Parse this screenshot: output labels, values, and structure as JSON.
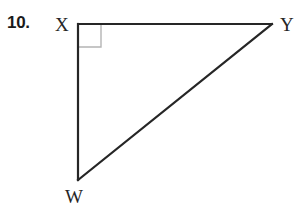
{
  "problem": {
    "number_label": "10."
  },
  "figure": {
    "name": "right-triangle",
    "background_color": "#ffffff",
    "stroke_color": "#262626",
    "right_angle_marker_color": "#b4b4b4",
    "vertices": [
      {
        "id": "X",
        "label": "X",
        "x": 78,
        "y": 24
      },
      {
        "id": "Y",
        "label": "Y",
        "x": 272,
        "y": 24
      },
      {
        "id": "W",
        "label": "W",
        "x": 78,
        "y": 180
      }
    ],
    "edges": [
      {
        "from": "X",
        "to": "Y",
        "name": "segment-xy",
        "stroke_width": 1.8
      },
      {
        "from": "X",
        "to": "W",
        "name": "segment-xw",
        "stroke_width": 2.2
      },
      {
        "from": "W",
        "to": "Y",
        "name": "segment-wy",
        "stroke_width": 2.2
      }
    ],
    "right_angle": {
      "at_vertex": "X",
      "marker_size": 23,
      "stroke_width": 1.4
    },
    "labels": {
      "x": "X",
      "y": "Y",
      "w": "W"
    }
  }
}
